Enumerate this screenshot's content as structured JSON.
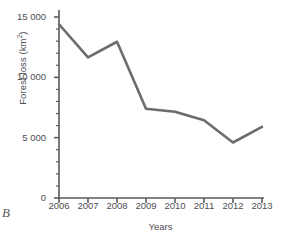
{
  "panel": {
    "letter": "B"
  },
  "chart_data": {
    "type": "line",
    "title": "",
    "xlabel": "Years",
    "ylabel": "Forest loss (km²)",
    "categories": [
      "2006",
      "2007",
      "2008",
      "2009",
      "2010",
      "2011",
      "2012",
      "2013"
    ],
    "values": [
      14400,
      11650,
      12950,
      7400,
      7150,
      6450,
      4600,
      5900
    ],
    "series": [
      {
        "name": "Forest loss",
        "values": [
          14400,
          11650,
          12950,
          7400,
          7150,
          6450,
          4600,
          5900
        ]
      }
    ],
    "ylim": [
      0,
      15600
    ],
    "xlim": [
      2006,
      2013
    ],
    "ytick_labels": [
      "0",
      "5 000",
      "10 000",
      "15 000"
    ],
    "ytick_values": [
      0,
      5000,
      10000,
      15000
    ],
    "minor_ytick_step": 1000,
    "xtick_labels": [
      "2006",
      "2007",
      "2008",
      "2009",
      "2010",
      "2011",
      "2012",
      "2013"
    ],
    "grid": false,
    "legend": false,
    "line_color": "#6b6b70",
    "axis_color": "#5a5a5f",
    "text_color": "#4d4d52",
    "background": "#ffffff"
  }
}
